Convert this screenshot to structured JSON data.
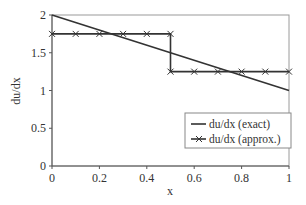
{
  "chart_data": {
    "type": "line",
    "title": "",
    "xlabel": "x",
    "ylabel": "du/dx",
    "xlim": [
      0,
      1
    ],
    "ylim": [
      0,
      2
    ],
    "xticks": [
      0,
      0.2,
      0.4,
      0.6,
      0.8,
      1
    ],
    "xtick_labels": [
      "0",
      "0.2",
      "0.4",
      "0.6",
      "0.8",
      "1"
    ],
    "yticks": [
      0,
      0.5,
      1,
      1.5,
      2
    ],
    "ytick_labels": [
      "0",
      "0.5",
      "1",
      "1.5",
      "2"
    ],
    "grid": false,
    "legend_position": "bottom-right",
    "series": [
      {
        "name": "du/dx (exact)",
        "marker": "none",
        "color": "#333333",
        "x": [
          0,
          1
        ],
        "y": [
          2,
          1
        ]
      },
      {
        "name": "du/dx (approx.)",
        "marker": "x",
        "color": "#333333",
        "x": [
          0,
          0.1,
          0.2,
          0.3,
          0.4,
          0.5,
          0.5,
          0.6,
          0.7,
          0.8,
          0.9,
          1.0
        ],
        "y": [
          1.75,
          1.75,
          1.75,
          1.75,
          1.75,
          1.75,
          1.25,
          1.25,
          1.25,
          1.25,
          1.25,
          1.25
        ]
      }
    ]
  }
}
